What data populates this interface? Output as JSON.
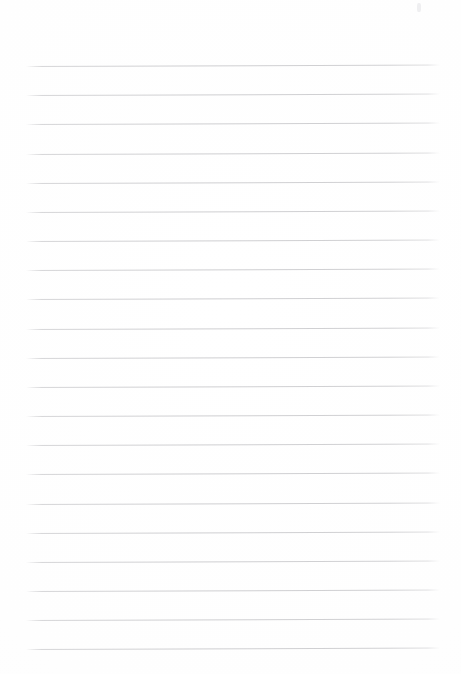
{
  "document": {
    "kind": "lined-paper",
    "title": "Blank ruled notebook page",
    "body_text": "",
    "header_text": "",
    "footer_text": "",
    "page_number": ""
  },
  "canvas": {
    "width": 461,
    "height": 674,
    "background_color": "#fefefe"
  },
  "ruling": {
    "line_color": "#c6c6c9",
    "line_count": 21,
    "line_thickness_px": 1,
    "first_line_y": 66,
    "line_spacing_px": 29.15,
    "line_start_x": 26,
    "line_end_x": 440,
    "tilt_degrees": -0.2,
    "top_margin_px": 66,
    "bottom_margin_px": 25,
    "left_margin_px": 26,
    "right_margin_px": 21,
    "lines": [
      {
        "index": 1,
        "y": 66,
        "content": ""
      },
      {
        "index": 2,
        "y": 95,
        "content": ""
      },
      {
        "index": 3,
        "y": 124,
        "content": ""
      },
      {
        "index": 4,
        "y": 154,
        "content": ""
      },
      {
        "index": 5,
        "y": 183,
        "content": ""
      },
      {
        "index": 6,
        "y": 212,
        "content": ""
      },
      {
        "index": 7,
        "y": 241,
        "content": ""
      },
      {
        "index": 8,
        "y": 270,
        "content": ""
      },
      {
        "index": 9,
        "y": 299,
        "content": ""
      },
      {
        "index": 10,
        "y": 329,
        "content": ""
      },
      {
        "index": 11,
        "y": 358,
        "content": ""
      },
      {
        "index": 12,
        "y": 387,
        "content": ""
      },
      {
        "index": 13,
        "y": 416,
        "content": ""
      },
      {
        "index": 14,
        "y": 445,
        "content": ""
      },
      {
        "index": 15,
        "y": 474,
        "content": ""
      },
      {
        "index": 16,
        "y": 504,
        "content": ""
      },
      {
        "index": 17,
        "y": 533,
        "content": ""
      },
      {
        "index": 18,
        "y": 562,
        "content": ""
      },
      {
        "index": 19,
        "y": 591,
        "content": ""
      },
      {
        "index": 20,
        "y": 620,
        "content": ""
      },
      {
        "index": 21,
        "y": 649,
        "content": ""
      }
    ]
  },
  "artifacts": {
    "corner_speck": {
      "name": "scanner-speck",
      "x": 417,
      "y": 3,
      "color": "#e1e1e6"
    }
  }
}
